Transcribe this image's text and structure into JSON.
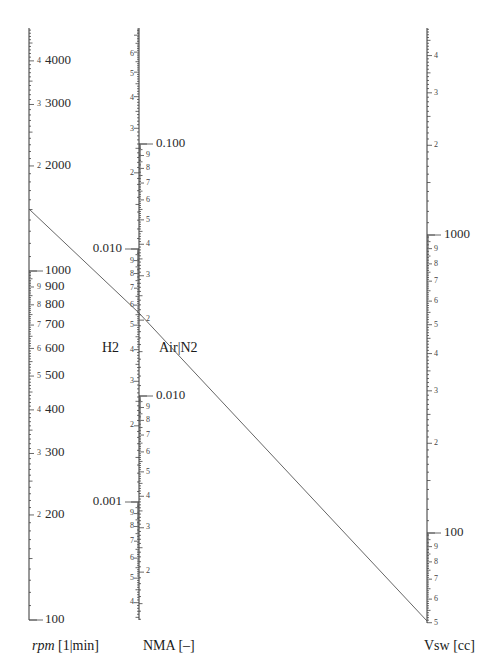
{
  "chart_data": {
    "type": "nomogram",
    "title": "",
    "axes": [
      {
        "id": "rpm",
        "title_italic": "rpm",
        "title_rest": " [1|min]",
        "scale": "log",
        "x": 29,
        "range": [
          100,
          4960
        ],
        "y_top": 28,
        "y_bottom": 620,
        "major_labels": [
          {
            "value": 100,
            "text": "100",
            "y": 620
          },
          {
            "value": 200,
            "text": "200",
            "y": 515,
            "minor": "2"
          },
          {
            "value": 300,
            "text": "300",
            "y": 453,
            "minor": "3"
          },
          {
            "value": 400,
            "text": "400",
            "y": 410,
            "minor": "4"
          },
          {
            "value": 500,
            "text": "500",
            "y": 376,
            "minor": "5"
          },
          {
            "value": 600,
            "text": "600",
            "y": 349,
            "minor": "6"
          },
          {
            "value": 700,
            "text": "700",
            "y": 325,
            "minor": "7"
          },
          {
            "value": 800,
            "text": "800",
            "y": 305,
            "minor": "8"
          },
          {
            "value": 900,
            "text": "900",
            "y": 287,
            "minor": "9"
          },
          {
            "value": 1000,
            "text": "1000",
            "y": 271
          },
          {
            "value": 2000,
            "text": "2000",
            "y": 166,
            "minor": "2"
          },
          {
            "value": 3000,
            "text": "3000",
            "y": 104,
            "minor": "3"
          },
          {
            "value": 4000,
            "text": "4000",
            "y": 61,
            "minor": "4"
          }
        ]
      },
      {
        "id": "nma",
        "title": "NMA [–]",
        "scale": "log",
        "x": 139,
        "y_top": 28,
        "y_bottom": 620,
        "sub_scales": [
          {
            "gas": "H2",
            "side": "left",
            "decade_px": 253,
            "anchor_value": 0.01,
            "anchor_y": 249,
            "major_labels": [
              {
                "value": 0.01,
                "text": "0.010",
                "y": 249
              },
              {
                "value": 0.001,
                "text": "0.001",
                "y": 502
              }
            ],
            "minor_labels": [
              {
                "text": "6",
                "y": 54
              },
              {
                "text": "5",
                "y": 74
              },
              {
                "text": "4",
                "y": 98
              },
              {
                "text": "3",
                "y": 129
              },
              {
                "text": "2",
                "y": 173
              },
              {
                "text": "9",
                "y": 261
              },
              {
                "text": "8",
                "y": 274
              },
              {
                "text": "7",
                "y": 288
              },
              {
                "text": "6",
                "y": 305
              },
              {
                "text": "5",
                "y": 325
              },
              {
                "text": "4",
                "y": 350
              },
              {
                "text": "3",
                "y": 381
              },
              {
                "text": "2",
                "y": 425
              },
              {
                "text": "9",
                "y": 513
              },
              {
                "text": "8",
                "y": 526
              },
              {
                "text": "7",
                "y": 541
              },
              {
                "text": "6",
                "y": 558
              },
              {
                "text": "5",
                "y": 578
              },
              {
                "text": "4",
                "y": 602
              }
            ]
          },
          {
            "gas": "Air|N2",
            "side": "right",
            "decade_px": 252,
            "anchor_value": 0.1,
            "anchor_y": 144,
            "major_labels": [
              {
                "value": 0.1,
                "text": "0.100",
                "y": 144
              },
              {
                "value": 0.01,
                "text": "0.010",
                "y": 396
              }
            ],
            "minor_labels": [
              {
                "text": "9",
                "y": 155
              },
              {
                "text": "8",
                "y": 168
              },
              {
                "text": "7",
                "y": 183
              },
              {
                "text": "6",
                "y": 200
              },
              {
                "text": "5",
                "y": 220
              },
              {
                "text": "4",
                "y": 244
              },
              {
                "text": "3",
                "y": 275
              },
              {
                "text": "2",
                "y": 319
              },
              {
                "text": "9",
                "y": 407
              },
              {
                "text": "8",
                "y": 420
              },
              {
                "text": "7",
                "y": 435
              },
              {
                "text": "6",
                "y": 452
              },
              {
                "text": "5",
                "y": 472
              },
              {
                "text": "4",
                "y": 496
              },
              {
                "text": "3",
                "y": 527
              },
              {
                "text": "2",
                "y": 571
              }
            ]
          }
        ]
      },
      {
        "id": "vsw",
        "title": "Vsw [cc]",
        "scale": "log",
        "x": 427,
        "range": [
          50,
          5500
        ],
        "y_top": 28,
        "y_bottom": 623,
        "major_labels": [
          {
            "value": 1000,
            "text": "1000",
            "y": 235
          },
          {
            "value": 100,
            "text": "100",
            "y": 533
          }
        ],
        "minor_labels": [
          {
            "text": "4",
            "y": 56
          },
          {
            "text": "3",
            "y": 93
          },
          {
            "text": "2",
            "y": 145
          },
          {
            "text": "9",
            "y": 249
          },
          {
            "text": "8",
            "y": 264
          },
          {
            "text": "7",
            "y": 281
          },
          {
            "text": "6",
            "y": 301
          },
          {
            "text": "5",
            "y": 325
          },
          {
            "text": "4",
            "y": 354
          },
          {
            "text": "3",
            "y": 391
          },
          {
            "text": "2",
            "y": 443
          },
          {
            "text": "9",
            "y": 547
          },
          {
            "text": "8",
            "y": 562
          },
          {
            "text": "7",
            "y": 579
          },
          {
            "text": "6",
            "y": 599
          },
          {
            "text": "5",
            "y": 623
          }
        ]
      }
    ],
    "gas_labels": [
      {
        "text": "H2",
        "x": 102,
        "y": 349
      },
      {
        "text": "Air|N2",
        "x": 159,
        "y": 349
      }
    ],
    "isopleth": {
      "points": [
        [
          29,
          209
        ],
        [
          139,
          313
        ],
        [
          427,
          621
        ]
      ],
      "rpm_value": 1500,
      "nma_h2_value": 0.0054,
      "nma_airn2_value": 0.021,
      "vsw_value": 62
    }
  },
  "axis_titles": {
    "rpm_italic": "rpm",
    "rpm_units": " [1|min]",
    "nma": "NMA [–]",
    "vsw": "Vsw [cc]"
  }
}
